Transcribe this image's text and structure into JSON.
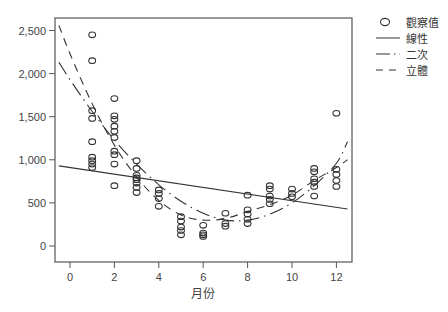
{
  "chart_data": {
    "type": "scatter",
    "title": "",
    "xlabel": "月份",
    "ylabel": "",
    "xlim": [
      -0.5,
      12.5
    ],
    "ylim": [
      -200,
      2650
    ],
    "xticks": [
      0,
      2,
      4,
      6,
      8,
      10,
      12
    ],
    "yticks": [
      0,
      500,
      1000,
      1500,
      2000,
      2500
    ],
    "ytick_labels": [
      "0",
      "500",
      "1,000",
      "1,500",
      "2,000",
      "2,500"
    ],
    "xtick_labels": [
      "0",
      "2",
      "4",
      "6",
      "8",
      "10",
      "12"
    ],
    "grid": false,
    "legend_position": "upper-right-outside",
    "legend": [
      "觀察值",
      "線性",
      "二次",
      "立體"
    ],
    "series": [
      {
        "name": "觀察值",
        "kind": "scatter",
        "marker": "open-circle",
        "points": [
          [
            1,
            2450
          ],
          [
            1,
            2150
          ],
          [
            1,
            1570
          ],
          [
            1,
            1480
          ],
          [
            1,
            1210
          ],
          [
            1,
            1030
          ],
          [
            1,
            990
          ],
          [
            1,
            950
          ],
          [
            1,
            910
          ],
          [
            2,
            1710
          ],
          [
            2,
            1510
          ],
          [
            2,
            1470
          ],
          [
            2,
            1390
          ],
          [
            2,
            1330
          ],
          [
            2,
            1260
          ],
          [
            2,
            1100
          ],
          [
            2,
            1060
          ],
          [
            2,
            950
          ],
          [
            2,
            700
          ],
          [
            3,
            990
          ],
          [
            3,
            900
          ],
          [
            3,
            820
          ],
          [
            3,
            790
          ],
          [
            3,
            770
          ],
          [
            3,
            730
          ],
          [
            3,
            680
          ],
          [
            3,
            620
          ],
          [
            4,
            650
          ],
          [
            4,
            610
          ],
          [
            4,
            550
          ],
          [
            4,
            460
          ],
          [
            5,
            340
          ],
          [
            5,
            290
          ],
          [
            5,
            220
          ],
          [
            5,
            180
          ],
          [
            5,
            130
          ],
          [
            6,
            240
          ],
          [
            6,
            150
          ],
          [
            6,
            130
          ],
          [
            6,
            110
          ],
          [
            7,
            380
          ],
          [
            7,
            260
          ],
          [
            7,
            230
          ],
          [
            8,
            590
          ],
          [
            8,
            420
          ],
          [
            8,
            370
          ],
          [
            8,
            310
          ],
          [
            8,
            260
          ],
          [
            9,
            700
          ],
          [
            9,
            660
          ],
          [
            9,
            580
          ],
          [
            9,
            540
          ],
          [
            9,
            490
          ],
          [
            10,
            660
          ],
          [
            10,
            610
          ],
          [
            10,
            570
          ],
          [
            11,
            900
          ],
          [
            11,
            860
          ],
          [
            11,
            780
          ],
          [
            11,
            740
          ],
          [
            11,
            690
          ],
          [
            11,
            580
          ],
          [
            12,
            1540
          ],
          [
            12,
            890
          ],
          [
            12,
            830
          ],
          [
            12,
            760
          ],
          [
            12,
            690
          ]
        ]
      },
      {
        "name": "線性",
        "kind": "line",
        "style": "solid",
        "x": [
          -0.5,
          12.5
        ],
        "values": [
          930,
          430
        ]
      },
      {
        "name": "二次",
        "kind": "line",
        "style": "dash-dot",
        "x": [
          -0.5,
          0,
          1,
          2,
          3,
          4,
          5,
          6,
          7,
          8,
          9,
          10,
          11,
          12,
          12.5
        ],
        "values": [
          2130,
          1930,
          1560,
          1230,
          950,
          710,
          520,
          380,
          300,
          300,
          370,
          500,
          700,
          960,
          1210
        ]
      },
      {
        "name": "立體",
        "kind": "line",
        "style": "dashed",
        "x": [
          -0.5,
          0,
          1,
          2,
          3,
          4,
          5,
          6,
          7,
          8,
          9,
          10,
          11,
          12,
          12.5
        ],
        "values": [
          2560,
          2230,
          1650,
          1170,
          800,
          530,
          360,
          300,
          320,
          400,
          480,
          590,
          760,
          910,
          1000
        ]
      }
    ]
  },
  "legend": {
    "items": [
      {
        "label": "觀察值",
        "icon": "open-circle-icon"
      },
      {
        "label": "線性",
        "icon": "solid-line-icon"
      },
      {
        "label": "二次",
        "icon": "dash-dot-line-icon"
      },
      {
        "label": "立體",
        "icon": "dashed-line-icon"
      }
    ]
  },
  "axes": {
    "x_title": "月份"
  },
  "colors": {
    "ink": "#333333",
    "axis": "#555555",
    "background": "#ffffff"
  }
}
